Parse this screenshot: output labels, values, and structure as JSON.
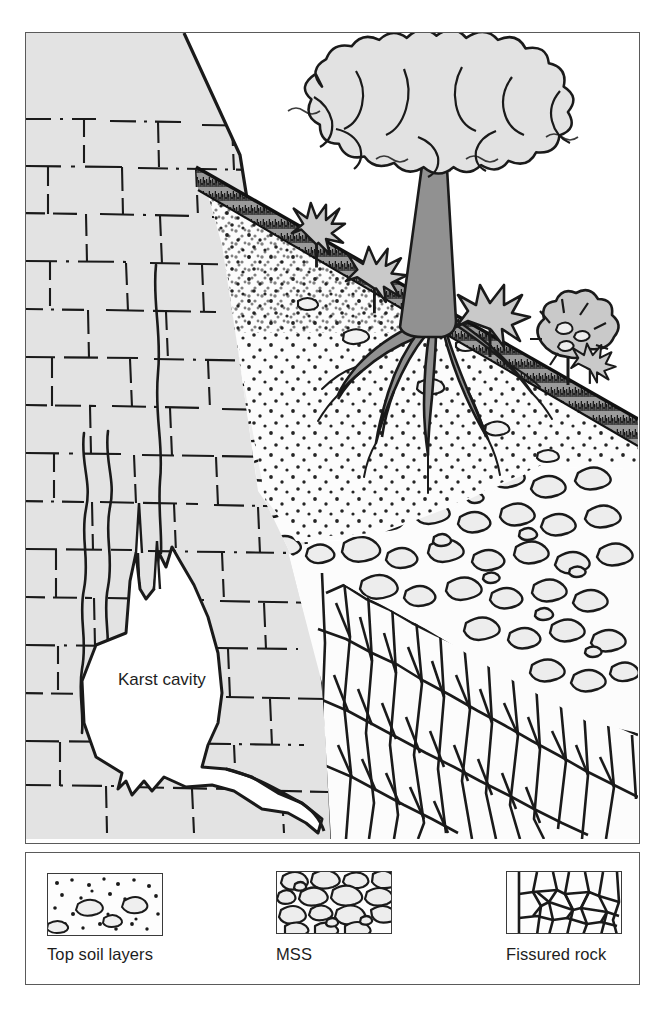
{
  "figure": {
    "kind": "geological-cross-section"
  },
  "diagram": {
    "labels": {
      "karst_cavity": "Karst cavity"
    },
    "colors": {
      "limestone_fill": "#e3e3e3",
      "canopy_fill": "#e2e2e2",
      "trunk_fill": "#919191",
      "shrub_fill": "#c9c9c9",
      "topsoil_band": "#8d8d8d",
      "soil_fill": "#fbfbfb",
      "mss_fill": "#fbfbfb",
      "block_fill": "#ededed",
      "fissured_fill": "#fcfcfc",
      "cavity_fill": "#ffffff",
      "ink": "#1a1a1a",
      "frame": "#5a5a5a"
    },
    "zones": [
      {
        "name": "limestone-karst-massif",
        "side": "left"
      },
      {
        "name": "karst-cavity",
        "side": "left"
      },
      {
        "name": "top-soil-layers",
        "side": "slope-surface"
      },
      {
        "name": "mss-block-layer",
        "side": "right"
      },
      {
        "name": "fissured-rock",
        "side": "bottom-right"
      }
    ],
    "vegetation": {
      "tree": {
        "name": "tree",
        "canopy": "broadleaf"
      },
      "shrub_count": 4
    }
  },
  "legend": {
    "items": [
      {
        "id": "top-soil-layers",
        "label": "Top soil layers",
        "pattern": "stipple-with-clasts"
      },
      {
        "id": "mss",
        "label": "MSS",
        "pattern": "packed-blocks"
      },
      {
        "id": "fissured-rock",
        "label": "Fissured rock",
        "pattern": "vertical-fissures"
      }
    ]
  }
}
